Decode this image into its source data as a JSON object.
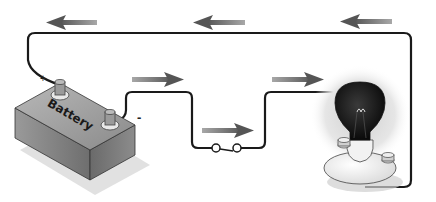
{
  "diagram": {
    "type": "circuit",
    "components": [
      {
        "id": "battery",
        "label": "Battery",
        "positive_symbol": "+",
        "negative_symbol": "-"
      },
      {
        "id": "switch",
        "label": "",
        "state": "closed"
      },
      {
        "id": "bulb",
        "label": "",
        "state": "lit"
      }
    ],
    "wire_color": "#1a1a1a",
    "arrow_color": "#7a7a7a",
    "arrows": [
      {
        "position": "top-left",
        "direction": "left"
      },
      {
        "position": "top-middle",
        "direction": "left"
      },
      {
        "position": "top-right",
        "direction": "left"
      },
      {
        "position": "battery-negative",
        "direction": "right"
      },
      {
        "position": "switch",
        "direction": "right"
      },
      {
        "position": "bulb-input",
        "direction": "right"
      }
    ]
  }
}
